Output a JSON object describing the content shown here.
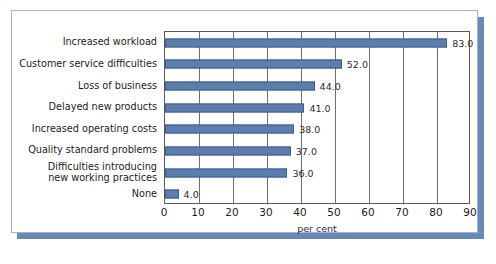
{
  "chart_data": {
    "type": "bar",
    "orientation": "horizontal",
    "title": "",
    "xlabel": "per cent",
    "ylabel": "",
    "xlim": [
      0,
      90
    ],
    "xticks": [
      0,
      10,
      20,
      30,
      40,
      50,
      60,
      70,
      80,
      90
    ],
    "grid": true,
    "legend": null,
    "categories": [
      "Increased workload",
      "Customer service difficulties",
      "Loss of business",
      "Delayed new products",
      "Increased operating costs",
      "Quality standard problems",
      "Difficulties introducing new working practices",
      "None"
    ],
    "values": [
      83.0,
      52.0,
      44.0,
      41.0,
      38.0,
      37.0,
      36.0,
      4.0
    ],
    "data_labels": [
      "83.0",
      "52.0",
      "44.0",
      "41.0",
      "38.0",
      "37.0",
      "36.0",
      "4.0"
    ],
    "bar_color": "#5c7eae",
    "bar_edge_color": "#3f5d89"
  },
  "figure": {
    "caption": "",
    "frame_color": "#9fb3d1",
    "shadow_color": "#6b87b5"
  },
  "axis": {
    "x_title": "per cent",
    "tick_labels": [
      "0",
      "10",
      "20",
      "30",
      "40",
      "50",
      "60",
      "70",
      "80",
      "90"
    ]
  },
  "category_labels": [
    {
      "line1": "Increased workload",
      "line2": ""
    },
    {
      "line1": "Customer service difficulties",
      "line2": ""
    },
    {
      "line1": "Loss of business",
      "line2": ""
    },
    {
      "line1": "Delayed new products",
      "line2": ""
    },
    {
      "line1": "Increased operating costs",
      "line2": ""
    },
    {
      "line1": "Quality standard problems",
      "line2": ""
    },
    {
      "line1": "Difficulties introducing",
      "line2": "new working practices"
    },
    {
      "line1": "None",
      "line2": ""
    }
  ]
}
